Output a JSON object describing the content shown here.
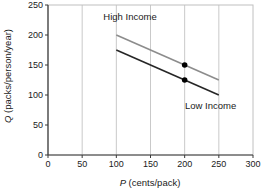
{
  "chart_data": {
    "type": "line",
    "title": "",
    "xlabel_var": "P",
    "xlabel_rest": " (cents/pack)",
    "ylabel_var": "Q",
    "ylabel_rest": " (packs/person/year)",
    "xlim": [
      0,
      300
    ],
    "ylim": [
      0,
      250
    ],
    "xticks": [
      0,
      50,
      100,
      150,
      200,
      250,
      300
    ],
    "yticks": [
      0,
      50,
      100,
      150,
      200,
      250
    ],
    "grid": "vertical-only",
    "legend": "none",
    "series": [
      {
        "name": "High Income",
        "color": "#8c8c8c",
        "points": [
          [
            100,
            200
          ],
          [
            250,
            125
          ]
        ],
        "markers": [
          [
            200,
            150
          ]
        ]
      },
      {
        "name": "Low Income",
        "color": "#262626",
        "points": [
          [
            100,
            175
          ],
          [
            250,
            100
          ]
        ],
        "markers": [
          [
            200,
            125
          ]
        ]
      }
    ],
    "annotations": [
      {
        "text": "High Income",
        "x": 120,
        "y": 230
      },
      {
        "text": "Low Income",
        "x": 238,
        "y": 82
      }
    ],
    "marker_color": "#000000",
    "colors": {
      "grid": "#c9c9c9",
      "frame": "#c0c0c0",
      "axis": "#3a3a3a",
      "text": "#1a1a1a"
    }
  }
}
